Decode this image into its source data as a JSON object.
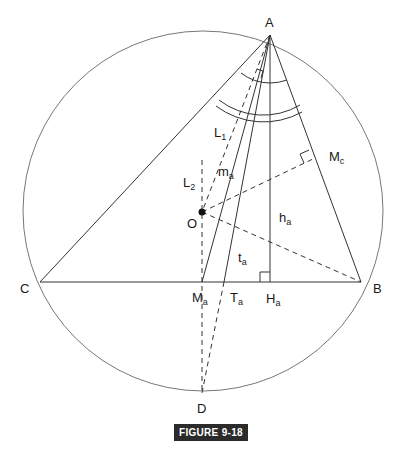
{
  "figure_caption": "FIGURE 9-18",
  "colors": {
    "line": "#333333",
    "circle": "#777777",
    "caption_bg": "#2b2b2b",
    "caption_text": "#ffffff"
  },
  "points": {
    "A": {
      "label": "A",
      "x": 270,
      "y": 35
    },
    "B": {
      "label": "B",
      "x": 361,
      "y": 282
    },
    "C": {
      "label": "C",
      "x": 40,
      "y": 282
    },
    "O": {
      "label": "O",
      "x": 202,
      "y": 212
    },
    "Ma": {
      "label": "M",
      "sub": "a",
      "x": 202,
      "y": 282
    },
    "Ta": {
      "label": "T",
      "sub": "a",
      "x": 224,
      "y": 282
    },
    "Ha": {
      "label": "H",
      "sub": "a",
      "x": 270,
      "y": 282
    },
    "Mc": {
      "label": "M",
      "sub": "c",
      "x": 315,
      "y": 158
    },
    "D": {
      "label": "D",
      "x": 202,
      "y": 393
    }
  },
  "segment_labels": {
    "L1": {
      "label": "L",
      "sub": "1"
    },
    "L2": {
      "label": "L",
      "sub": "2"
    },
    "ma": {
      "label": "m",
      "sub": "a"
    },
    "ha": {
      "label": "h",
      "sub": "a"
    },
    "ta": {
      "label": "t",
      "sub": "a"
    }
  },
  "circle": {
    "cx": 203,
    "cy": 211,
    "r": 180
  }
}
